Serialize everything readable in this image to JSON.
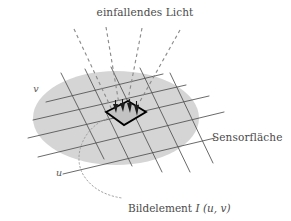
{
  "figure": {
    "title_label": "einfallendes Licht",
    "surface_label": "Sensorfläche",
    "caption_prefix": "Bildelement",
    "caption_symbol": "I",
    "caption_args": "(u, v)",
    "axis_v_label": "v",
    "axis_u_label": "u",
    "colors": {
      "background": "#ffffff",
      "sensor_disc": "#d4d4d4",
      "grid_line": "#4d4d4d",
      "ray_dashed": "#8a8a8a",
      "pixel_outline": "#000000",
      "pixel_fill": "#bdbdbd",
      "leader_dotted": "#9a9a9a",
      "text": "#4a4a4a"
    },
    "light_rays": [
      {
        "name": "ray-1",
        "x1": 74,
        "y1": 29,
        "x2": 113,
        "y2": 112
      },
      {
        "name": "ray-2",
        "x1": 106,
        "y1": 27,
        "x2": 120,
        "y2": 110
      },
      {
        "name": "ray-3",
        "x1": 142,
        "y1": 28,
        "x2": 126,
        "y2": 110
      },
      {
        "name": "ray-4",
        "x1": 180,
        "y1": 30,
        "x2": 134,
        "y2": 112
      }
    ],
    "arrow_count": 4,
    "grid": {
      "u_lines": 5,
      "v_lines": 5
    },
    "sensor_disc": {
      "cx": 116,
      "cy": 118,
      "rx": 83,
      "ry": 47
    },
    "pixel_cell": {
      "corners": "106,112 128,101 146,112 124,125"
    }
  }
}
